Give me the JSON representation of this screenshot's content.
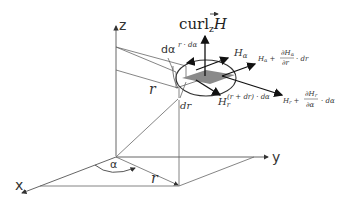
{
  "diagram": {
    "axes": {
      "x": "x",
      "y": "y",
      "z": "z"
    },
    "labels": {
      "angle": "α",
      "d_angle": "dα",
      "radius_upper": "r",
      "radius_lower": "r",
      "dr": "dr",
      "arc_length": "r · dα",
      "arc_length_outer": "(r + dr) · dα",
      "curl_main": "curl",
      "curl_sub": "z",
      "curl_vec": "H",
      "H_alpha": "H",
      "H_alpha_sub": "α",
      "H_r": "H",
      "H_r_sub": "r",
      "H_alpha_plus_prefix": "H",
      "H_alpha_plus_prefix_sub": "α",
      "H_alpha_plus_num": "∂H",
      "H_alpha_plus_num_sub": "α",
      "H_alpha_plus_den": "∂r",
      "H_alpha_plus_suffix": "· dr",
      "H_r_plus_prefix": "H",
      "H_r_plus_prefix_sub": "r",
      "H_r_plus_num": "∂H",
      "H_r_plus_num_sub": "r",
      "H_r_plus_den": "∂α",
      "H_r_plus_suffix": "· dα",
      "plus": "+"
    },
    "colors": {
      "line": "#555555",
      "arrow": "#222222",
      "patch": "#8a8a8a"
    }
  }
}
